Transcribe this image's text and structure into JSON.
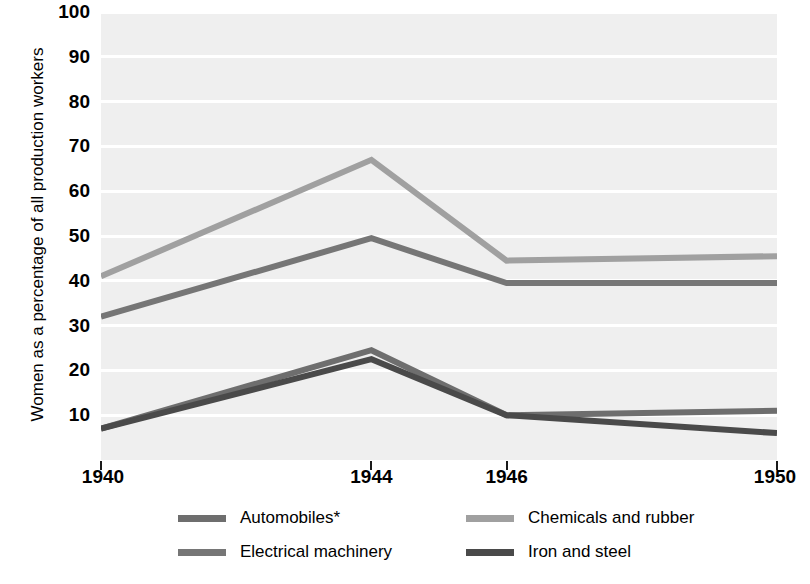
{
  "chart_data": {
    "type": "line",
    "title": "",
    "xlabel": "",
    "ylabel": "Women as a percentage of all production workers",
    "x": [
      1940,
      1944,
      1946,
      1950
    ],
    "xtick_labels": [
      "1940",
      "1944",
      "1946",
      "1950"
    ],
    "ytick_labels": [
      "10",
      "20",
      "30",
      "40",
      "50",
      "60",
      "70",
      "80",
      "90",
      "100"
    ],
    "yticks": [
      10,
      20,
      30,
      40,
      50,
      60,
      70,
      80,
      90,
      100
    ],
    "ylim": [
      0,
      100
    ],
    "xlim": [
      1940,
      1950
    ],
    "grid": true,
    "grid_orientation": "horizontal",
    "legend_position": "bottom",
    "plot_background": "#efefef",
    "gridline_color": "#ffffff",
    "series": [
      {
        "name": "Automobiles*",
        "color": "#6e6e6e",
        "values": [
          7.0,
          24.5,
          10.0,
          11.0
        ]
      },
      {
        "name": "Chemicals and rubber",
        "color": "#a0a0a0",
        "values": [
          41.0,
          67.0,
          44.5,
          45.5
        ]
      },
      {
        "name": "Electrical machinery",
        "color": "#767676",
        "values": [
          32.0,
          49.5,
          39.5,
          39.5
        ]
      },
      {
        "name": "Iron and steel",
        "color": "#4a4a4a",
        "values": [
          7.0,
          22.5,
          10.0,
          6.0
        ]
      }
    ]
  },
  "axis": {
    "y_title": "Women as a percentage of all production workers",
    "y_ticks": [
      {
        "label": "100",
        "value": 100
      },
      {
        "label": "90",
        "value": 90
      },
      {
        "label": "80",
        "value": 80
      },
      {
        "label": "70",
        "value": 70
      },
      {
        "label": "60",
        "value": 60
      },
      {
        "label": "50",
        "value": 50
      },
      {
        "label": "40",
        "value": 40
      },
      {
        "label": "30",
        "value": 30
      },
      {
        "label": "20",
        "value": 20
      },
      {
        "label": "10",
        "value": 10
      }
    ],
    "x_ticks": [
      {
        "label": "1940",
        "value": 1940
      },
      {
        "label": "1944",
        "value": 1944
      },
      {
        "label": "1946",
        "value": 1946
      },
      {
        "label": "1950",
        "value": 1950
      }
    ]
  },
  "legend": {
    "entries": [
      {
        "label": "Automobiles*",
        "color": "#6e6e6e"
      },
      {
        "label": "Chemicals and rubber",
        "color": "#a0a0a0"
      },
      {
        "label": "Electrical machinery",
        "color": "#767676"
      },
      {
        "label": "Iron and steel",
        "color": "#4a4a4a"
      }
    ]
  }
}
